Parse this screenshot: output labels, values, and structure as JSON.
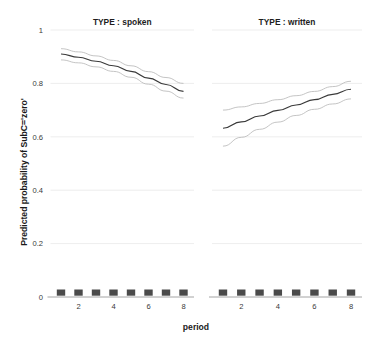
{
  "chart_data": {
    "type": "line",
    "title": "",
    "xlabel": "period",
    "ylabel": "Predicted probability of SubC='zero'",
    "xlim": [
      0.4,
      8.6
    ],
    "ylim": [
      0,
      1
    ],
    "yticks": [
      "0",
      "0.2",
      "0.4",
      "0.6",
      "0.8",
      "1"
    ],
    "ytick_values": [
      0,
      0.2,
      0.4,
      0.6,
      0.8,
      1
    ],
    "xticks": [
      "2",
      "4",
      "6",
      "8"
    ],
    "xtick_values": [
      2,
      4,
      6,
      8
    ],
    "grid": true,
    "legend": "none",
    "facet_variable": "TYPE",
    "panels": [
      {
        "label": "TYPE : spoken",
        "x": [
          1,
          2,
          3,
          4,
          5,
          6,
          7,
          8
        ],
        "fit": [
          0.91,
          0.898,
          0.883,
          0.866,
          0.845,
          0.82,
          0.796,
          0.77
        ],
        "upper": [
          0.93,
          0.918,
          0.903,
          0.886,
          0.866,
          0.844,
          0.822,
          0.8
        ],
        "lower": [
          0.888,
          0.877,
          0.862,
          0.845,
          0.823,
          0.797,
          0.771,
          0.745
        ],
        "rug_x": [
          1,
          2,
          3,
          4,
          5,
          6,
          7,
          8
        ]
      },
      {
        "label": "TYPE : written",
        "x": [
          1,
          2,
          3,
          4,
          5,
          6,
          7,
          8
        ],
        "fit": [
          0.632,
          0.656,
          0.678,
          0.699,
          0.719,
          0.739,
          0.759,
          0.778
        ],
        "upper": [
          0.7,
          0.712,
          0.725,
          0.739,
          0.754,
          0.77,
          0.788,
          0.808
        ],
        "lower": [
          0.565,
          0.598,
          0.628,
          0.655,
          0.68,
          0.703,
          0.723,
          0.742
        ],
        "rug_x": [
          1,
          2,
          3,
          4,
          5,
          6,
          7,
          8
        ]
      }
    ],
    "series_roles": {
      "fit": "predicted mean",
      "upper": "upper confidence limit",
      "lower": "lower confidence limit"
    },
    "colors": {
      "fit_line": "#3a3a3a",
      "ci_line": "#b9b9b9",
      "grid": "#e9e9e9",
      "axis": "#9a9a9a",
      "rug": "#4a4a4a",
      "background": "#ffffff"
    }
  }
}
